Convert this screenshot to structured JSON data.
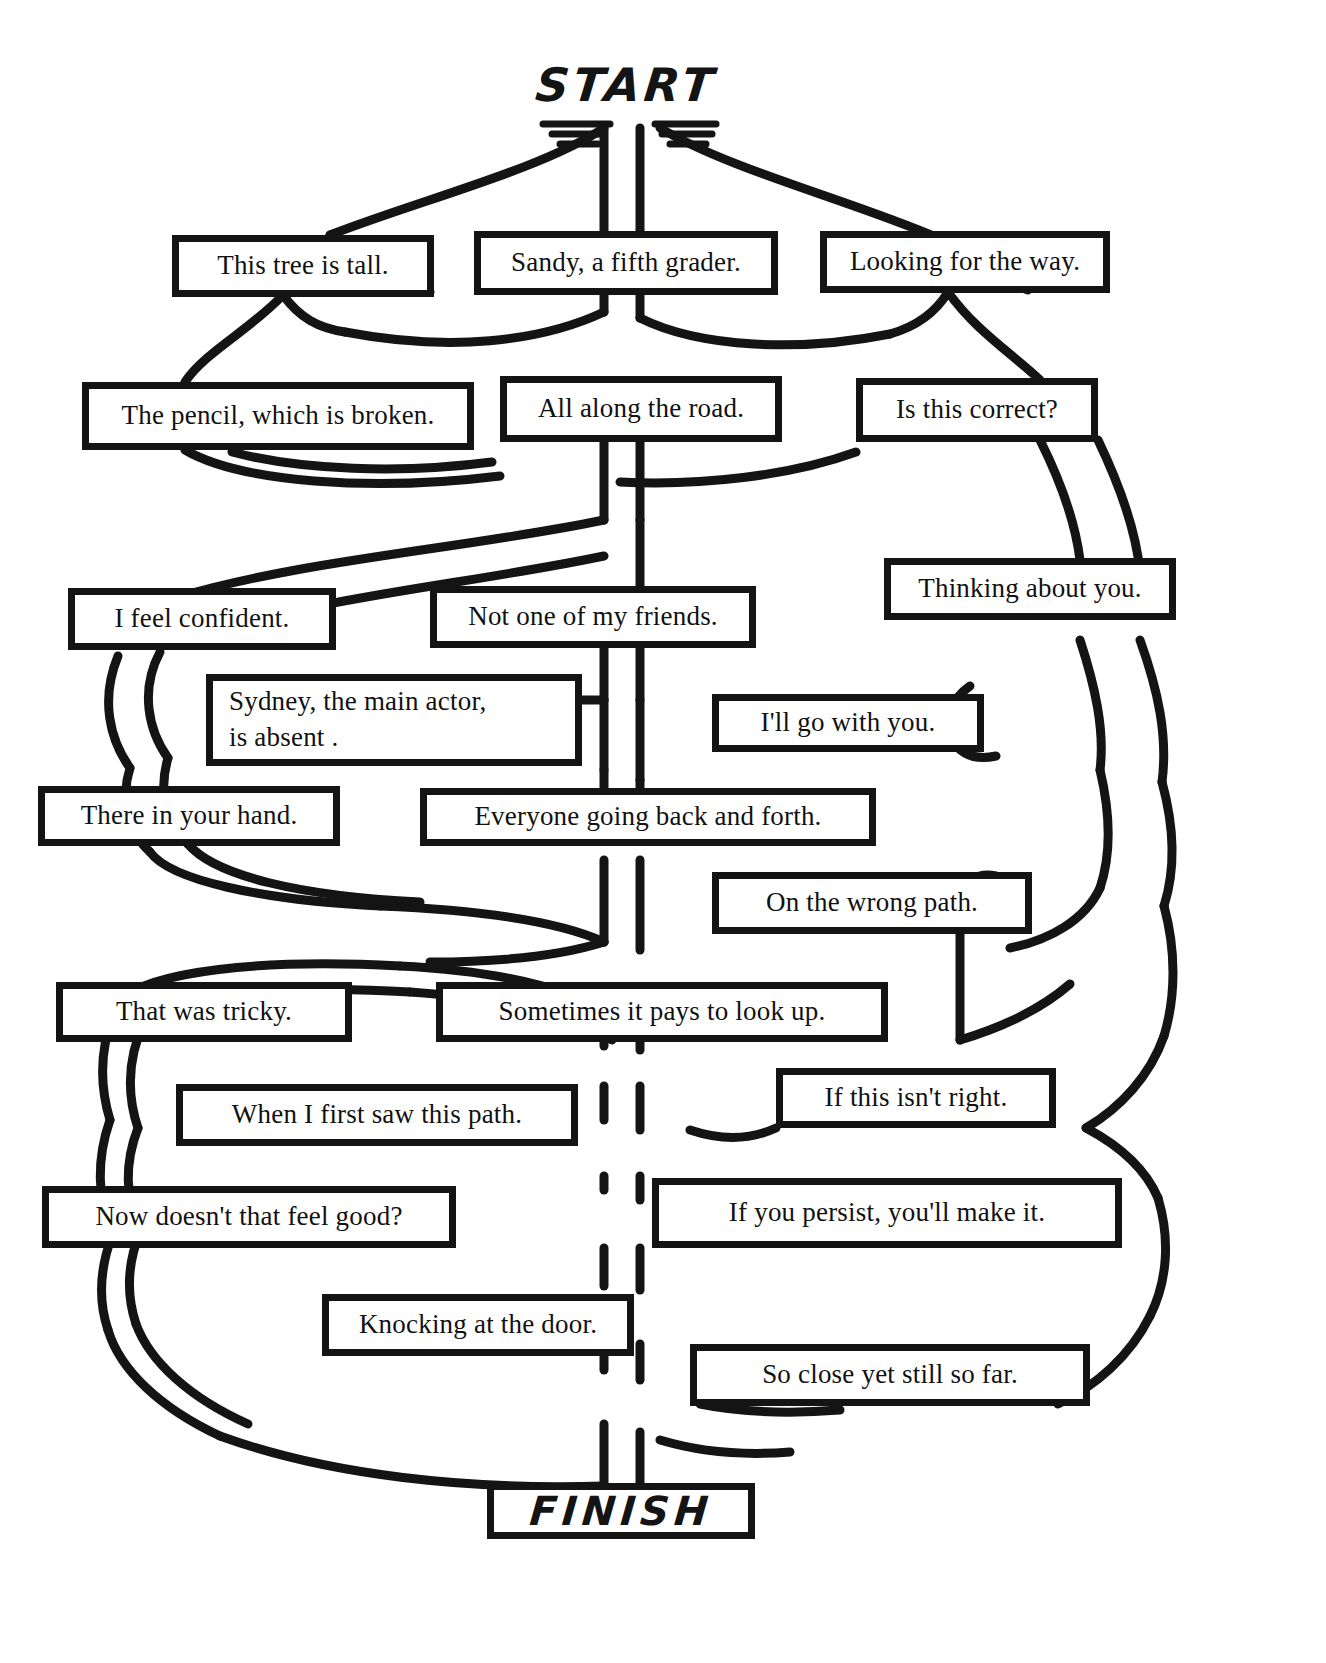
{
  "worksheet": {
    "type": "sentence-maze",
    "start_label": "START",
    "finish_label": "FINISH",
    "ink_color": "#141414",
    "paper_color": "#ffffff",
    "cell_count": 20,
    "row_count": 10
  },
  "cells": [
    {
      "id": "c1",
      "text": "This tree is tall.",
      "row": 1,
      "column": "left"
    },
    {
      "id": "c2",
      "text": "Sandy, a fifth grader.",
      "row": 1,
      "column": "center"
    },
    {
      "id": "c3",
      "text": "Looking for the way.",
      "row": 1,
      "column": "right"
    },
    {
      "id": "c4",
      "text": "The pencil, which is broken.",
      "row": 2,
      "column": "left"
    },
    {
      "id": "c5",
      "text": "All along the road.",
      "row": 2,
      "column": "center"
    },
    {
      "id": "c6",
      "text": "Is this correct?",
      "row": 2,
      "column": "right"
    },
    {
      "id": "c7",
      "text": "Thinking about you.",
      "row": 3,
      "column": "right"
    },
    {
      "id": "c8",
      "text": "I feel confident.",
      "row": 3,
      "column": "left"
    },
    {
      "id": "c9",
      "text": "Not one of my friends.",
      "row": 3,
      "column": "center"
    },
    {
      "id": "c10",
      "text": "Sydney, the main actor,\nis absent .",
      "row": 4,
      "column": "left"
    },
    {
      "id": "c11",
      "text": "I'll go with you.",
      "row": 4,
      "column": "right"
    },
    {
      "id": "c12",
      "text": "There in your hand.",
      "row": 5,
      "column": "left"
    },
    {
      "id": "c13",
      "text": "Everyone going back and forth.",
      "row": 5,
      "column": "center"
    },
    {
      "id": "c14",
      "text": "On the wrong path.",
      "row": 6,
      "column": "right"
    },
    {
      "id": "c15",
      "text": "That was tricky.",
      "row": 7,
      "column": "left"
    },
    {
      "id": "c16",
      "text": "Sometimes it pays to look up.",
      "row": 7,
      "column": "center"
    },
    {
      "id": "c17",
      "text": "If this isn't right.",
      "row": 8,
      "column": "right"
    },
    {
      "id": "c18",
      "text": "When I first saw this path.",
      "row": 8,
      "column": "left"
    },
    {
      "id": "c19",
      "text": "Now doesn't that feel good?",
      "row": 9,
      "column": "left"
    },
    {
      "id": "c20",
      "text": "If you persist, you'll make it.",
      "row": 9,
      "column": "right"
    },
    {
      "id": "c21",
      "text": "Knocking at the door.",
      "row": 10,
      "column": "left"
    },
    {
      "id": "c22",
      "text": "So close yet still so far.",
      "row": 10,
      "column": "right"
    }
  ]
}
